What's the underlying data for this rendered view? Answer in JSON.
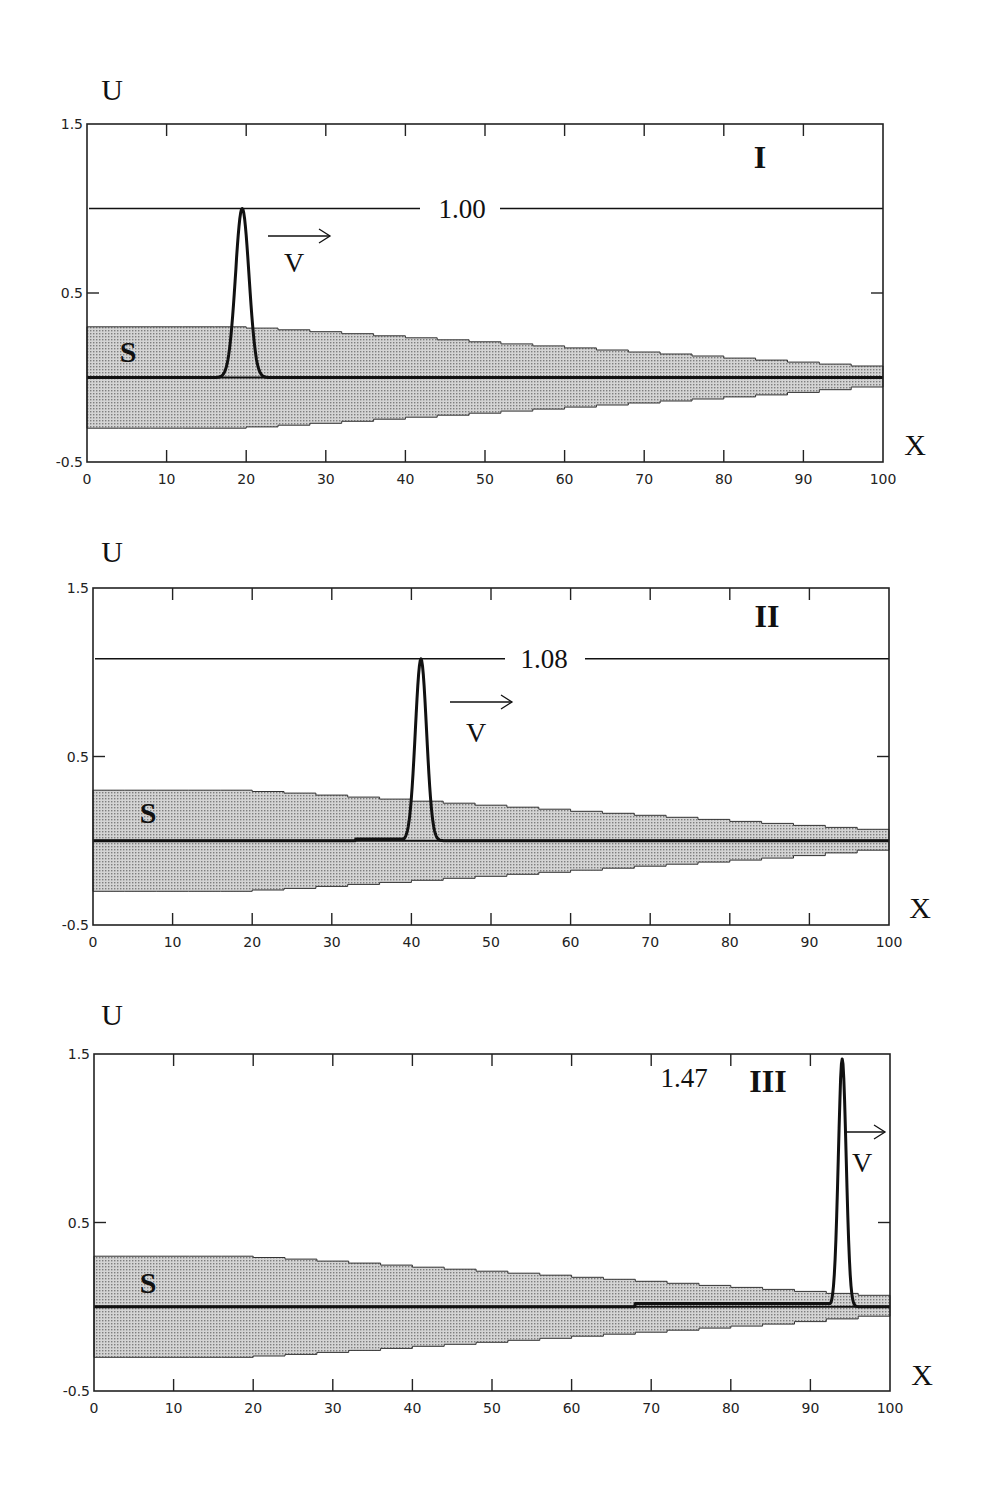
{
  "chart_data": [
    {
      "type": "line",
      "panel": "I",
      "title": "I",
      "xlabel": "X",
      "ylabel": "U",
      "xlim": [
        0,
        100
      ],
      "ylim": [
        -0.5,
        1.5
      ],
      "x_ticks": [
        0,
        10,
        20,
        30,
        40,
        50,
        60,
        70,
        80,
        90,
        100
      ],
      "y_ticks": [
        -0.5,
        0.5,
        1.5
      ],
      "grid": false,
      "series": [
        {
          "name": "U pulse",
          "peak_x": 19.5,
          "peak_u": 1.0,
          "width": 1.2
        },
        {
          "name": "S band upper",
          "x": [
            0,
            17,
            25,
            35,
            45,
            55,
            65,
            75,
            85,
            95,
            100
          ],
          "values": [
            0.3,
            0.3,
            0.28,
            0.25,
            0.22,
            0.19,
            0.16,
            0.13,
            0.1,
            0.07,
            0.06
          ]
        },
        {
          "name": "S band lower",
          "x": [
            0,
            17,
            25,
            35,
            45,
            55,
            65,
            75,
            85,
            95,
            100
          ],
          "values": [
            -0.3,
            -0.3,
            -0.28,
            -0.25,
            -0.22,
            -0.19,
            -0.16,
            -0.13,
            -0.1,
            -0.06,
            -0.04
          ]
        }
      ],
      "annotations": [
        {
          "text": "1.00",
          "type": "reference_line",
          "u": 1.0
        },
        {
          "text": "V",
          "type": "velocity_arrow",
          "direction": "right"
        },
        {
          "text": "S",
          "type": "band_label"
        }
      ]
    },
    {
      "type": "line",
      "panel": "II",
      "title": "II",
      "xlabel": "X",
      "ylabel": "U",
      "xlim": [
        0,
        100
      ],
      "ylim": [
        -0.5,
        1.5
      ],
      "x_ticks": [
        0,
        10,
        20,
        30,
        40,
        50,
        60,
        70,
        80,
        90,
        100
      ],
      "y_ticks": [
        -0.5,
        0.5,
        1.5
      ],
      "grid": false,
      "series": [
        {
          "name": "U pulse",
          "peak_x": 41.2,
          "peak_u": 1.08,
          "width": 1.0,
          "tail_from": 33,
          "tail_u": 0.01
        },
        {
          "name": "S band upper",
          "x": [
            0,
            17,
            25,
            35,
            45,
            55,
            65,
            75,
            85,
            95,
            100
          ],
          "values": [
            0.3,
            0.3,
            0.28,
            0.25,
            0.22,
            0.19,
            0.16,
            0.13,
            0.1,
            0.07,
            0.06
          ]
        },
        {
          "name": "S band lower",
          "x": [
            0,
            17,
            25,
            35,
            45,
            55,
            65,
            75,
            85,
            95,
            100
          ],
          "values": [
            -0.3,
            -0.3,
            -0.28,
            -0.25,
            -0.22,
            -0.19,
            -0.16,
            -0.13,
            -0.1,
            -0.06,
            -0.04
          ]
        }
      ],
      "annotations": [
        {
          "text": "1.08",
          "type": "reference_line",
          "u": 1.08
        },
        {
          "text": "V",
          "type": "velocity_arrow",
          "direction": "right"
        },
        {
          "text": "S",
          "type": "band_label"
        }
      ]
    },
    {
      "type": "line",
      "panel": "III",
      "title": "III",
      "xlabel": "X",
      "ylabel": "U",
      "xlim": [
        0,
        100
      ],
      "ylim": [
        -0.5,
        1.5
      ],
      "x_ticks": [
        0,
        10,
        20,
        30,
        40,
        50,
        60,
        70,
        80,
        90,
        100
      ],
      "y_ticks": [
        -0.5,
        0.5,
        1.5
      ],
      "grid": false,
      "series": [
        {
          "name": "U pulse",
          "peak_x": 94.0,
          "peak_u": 1.47,
          "width": 0.7,
          "tail_from": 68,
          "tail_u": 0.02
        },
        {
          "name": "S band upper",
          "x": [
            0,
            17,
            25,
            35,
            45,
            55,
            65,
            75,
            85,
            95,
            100
          ],
          "values": [
            0.3,
            0.3,
            0.28,
            0.25,
            0.22,
            0.19,
            0.16,
            0.13,
            0.1,
            0.07,
            0.06
          ]
        },
        {
          "name": "S band lower",
          "x": [
            0,
            17,
            25,
            35,
            45,
            55,
            65,
            75,
            85,
            95,
            100
          ],
          "values": [
            -0.3,
            -0.3,
            -0.28,
            -0.25,
            -0.22,
            -0.19,
            -0.16,
            -0.13,
            -0.1,
            -0.06,
            -0.04
          ]
        }
      ],
      "annotations": [
        {
          "text": "1.47",
          "type": "peak_label",
          "u": 1.47
        },
        {
          "text": "V",
          "type": "velocity_arrow",
          "direction": "right"
        },
        {
          "text": "S",
          "type": "band_label"
        }
      ]
    }
  ],
  "layout": {
    "panels": [
      {
        "frame": [
          87,
          124,
          883,
          462
        ],
        "u_label_pos": [
          112,
          100
        ],
        "x_label_pos": [
          915,
          455
        ],
        "id_pos": [
          760,
          168
        ],
        "ref_label_pos": [
          462,
          218
        ],
        "ref_gap": [
          420,
          500
        ],
        "arrow": [
          268,
          330,
          236
        ],
        "v_pos": [
          294,
          272
        ],
        "s_pos": [
          128,
          362
        ],
        "peak_label_pos": null
      },
      {
        "frame": [
          93,
          588,
          889,
          925
        ],
        "u_label_pos": [
          112,
          562
        ],
        "x_label_pos": [
          920,
          918
        ],
        "id_pos": [
          767,
          627
        ],
        "ref_label_pos": [
          544,
          668
        ],
        "ref_gap": [
          505,
          585
        ],
        "arrow": [
          450,
          512,
          702
        ],
        "v_pos": [
          476,
          742
        ],
        "s_pos": [
          148,
          823
        ],
        "peak_label_pos": null
      },
      {
        "frame": [
          94,
          1054,
          890,
          1391
        ],
        "u_label_pos": [
          112,
          1025
        ],
        "x_label_pos": [
          922,
          1385
        ],
        "id_pos": [
          768,
          1092
        ],
        "ref_label_pos": null,
        "ref_gap": null,
        "arrow": [
          846,
          885,
          1132
        ],
        "v_pos": [
          862,
          1172
        ],
        "s_pos": [
          148,
          1293
        ],
        "peak_label_pos": [
          684,
          1087
        ]
      }
    ]
  },
  "labels": {
    "y_axis": "U",
    "x_axis": "X",
    "band": "S",
    "velocity": "V",
    "panel_ids": [
      "I",
      "II",
      "III"
    ],
    "ref_values": [
      "1.00",
      "1.08",
      "1.47"
    ]
  },
  "colors": {
    "line": "#111111",
    "band_fill": "#bdbdbd",
    "band_dot": "#8a8a8a",
    "frame": "#222222",
    "background": "#ffffff"
  }
}
